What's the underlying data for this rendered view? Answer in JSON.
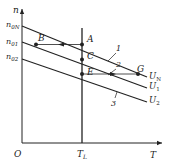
{
  "diagram": {
    "type": "motor speed-torque characteristics (voltage regulation)",
    "axes": {
      "y_label": "n",
      "x_label": "T",
      "origin_label": "O"
    },
    "y_ticks": [
      {
        "label": "n",
        "sub": "0N"
      },
      {
        "label": "n",
        "sub": "01"
      },
      {
        "label": "n",
        "sub": "02"
      }
    ],
    "x_ticks": [
      {
        "label": "T",
        "sub": "L"
      }
    ],
    "curves": [
      {
        "id": "1",
        "voltage_label": "U",
        "voltage_sub": "N"
      },
      {
        "id": "2",
        "voltage_label": "U",
        "voltage_sub": "1"
      },
      {
        "id": "3",
        "voltage_label": "U",
        "voltage_sub": "2"
      }
    ],
    "points": [
      "A",
      "B",
      "C",
      "E",
      "G"
    ],
    "colors": {
      "line": "#222222",
      "background": "#ffffff"
    }
  }
}
